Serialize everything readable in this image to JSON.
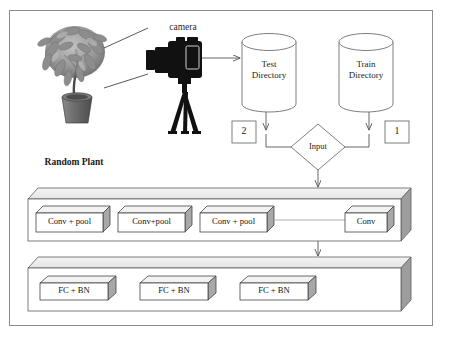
{
  "figure": {
    "border_color": "#8d8d8d",
    "background": "#ffffff"
  },
  "capture_stage": {
    "camera_label": "camera",
    "plant_label": "Random Plant",
    "camera_icon": "camera-tripod-icon",
    "plant_icon": "potted-plant-photo",
    "fov_lines": 2,
    "capture_arrow": "camera-to-test-directory-arrow"
  },
  "storage": {
    "test_directory": {
      "line1": "Test",
      "line2": "Directory",
      "badge": "2"
    },
    "train_directory": {
      "line1": "Train",
      "line2": "Directory",
      "badge": "1"
    }
  },
  "input_node": {
    "label": "Input",
    "shape": "diamond"
  },
  "conv_block": {
    "name": "convolutional-layers-slab",
    "layers": [
      {
        "label": "Conv + pool"
      },
      {
        "label": "Conv+pool"
      },
      {
        "label": "Conv + pool"
      },
      {
        "label": "Conv"
      }
    ],
    "connector": "dotted-line-between-conv3-and-conv"
  },
  "fc_block": {
    "name": "fully-connected-layers-slab",
    "layers": [
      {
        "label": "FC + BN"
      },
      {
        "label": "FC + BN"
      },
      {
        "label": "FC + BN"
      }
    ]
  },
  "colors": {
    "outline": "#6f6f6f",
    "box_outline": "#4a4a4a",
    "side_face": "#a8a8a8",
    "top_face": "#f2f2f2",
    "front_face": "#ffffff",
    "slab_side": "#9d9d9d",
    "slab_top": "#ededed",
    "arrow": "#555555",
    "camera_body": "#111111",
    "text": "#1c1c1c"
  }
}
